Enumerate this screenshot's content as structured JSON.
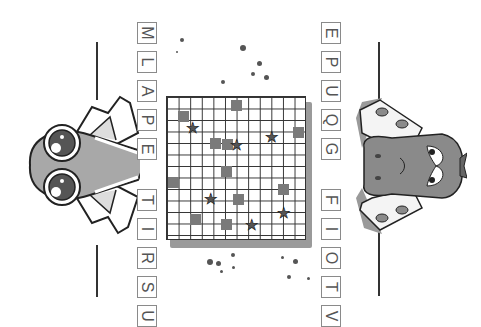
{
  "left_letters": [
    "M",
    "L",
    "A",
    "P",
    "E",
    "T",
    "I",
    "R",
    "S",
    "U"
  ],
  "right_letters": [
    "E",
    "P",
    "U",
    "Q",
    "G",
    "F",
    "I",
    "O",
    "T",
    "V"
  ],
  "characters": {
    "left": "frog-creature-peeking",
    "right": "grumpy-creature-peeking"
  },
  "board": {
    "cols": 12,
    "rows": 13,
    "shaded_cells": [
      [
        9,
        0
      ],
      [
        1,
        1
      ],
      [
        11,
        3
      ],
      [
        5,
        4
      ],
      [
        3,
        3
      ],
      [
        6,
        6
      ],
      [
        0,
        7
      ],
      [
        10,
        8
      ],
      [
        4,
        9
      ],
      [
        2,
        11
      ],
      [
        5,
        11
      ],
      [
        1,
        8
      ]
    ],
    "stars": [
      [
        2,
        2
      ],
      [
        6,
        4
      ],
      [
        10,
        3
      ],
      [
        4,
        9
      ],
      [
        7,
        11
      ],
      [
        10,
        10
      ]
    ]
  },
  "colors": {
    "ink": "#333333",
    "shade": "#7a7a7a",
    "character_fill": "#a8a8a8"
  }
}
